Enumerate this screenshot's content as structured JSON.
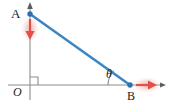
{
  "figure": {
    "type": "geometry-diagram",
    "background_color": "#ffffff",
    "width": 170,
    "height": 107
  },
  "axes": {
    "color": "#8c8c8c",
    "origin_label": "O",
    "vertical": {
      "name": "y-axis",
      "x": 30,
      "from_y": 100,
      "to_y": 3,
      "arrow": "up"
    },
    "horizontal": {
      "name": "x-axis",
      "y": 85,
      "from_x": 8,
      "to_x": 166,
      "arrow": "right"
    },
    "right_angle_marker": {
      "name": "right-angle-marker",
      "size": 8
    }
  },
  "points": [
    {
      "id": "A",
      "label": "A",
      "x": 30,
      "y": 14,
      "color": "#2f6fb5",
      "on_axis": "y-axis"
    },
    {
      "id": "B",
      "label": "B",
      "x": 130,
      "y": 85,
      "color": "#2f6fb5",
      "on_axis": "x-axis"
    }
  ],
  "segments": [
    {
      "id": "AB",
      "name": "segment-ab",
      "from": "A",
      "to": "B",
      "color": "#3d86c6",
      "width": 2.6
    }
  ],
  "angle": {
    "label": "θ",
    "name": "angle-theta",
    "vertex": "B",
    "between": [
      "x-axis",
      "segment-ab"
    ],
    "arc_color": "#8c8c8c"
  },
  "velocity_arrows": [
    {
      "id": "arrow-at-A",
      "name": "velocity-arrow-a",
      "direction": "down",
      "color": "#e2504a",
      "glow_color": "#f3b6b2",
      "anchor_x": 30,
      "anchor_y": 18,
      "length": 22
    },
    {
      "id": "arrow-at-B",
      "name": "velocity-arrow-b",
      "direction": "right",
      "color": "#e2504a",
      "glow_color": "#f3b6b2",
      "anchor_x": 134,
      "anchor_y": 85,
      "length": 24
    }
  ],
  "labels": {
    "point_a": "A",
    "point_b": "B",
    "origin": "O",
    "theta": "θ"
  }
}
